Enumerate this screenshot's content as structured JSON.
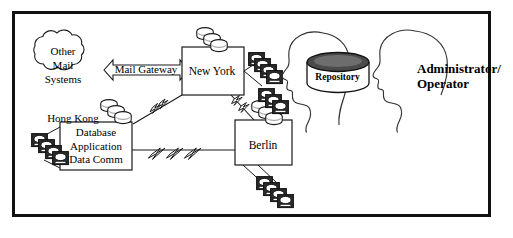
{
  "diagram": {
    "frame": {
      "border_color": "#111111"
    },
    "cloud": {
      "name": "other-mail-systems",
      "line1": "Other",
      "line2": "Mail",
      "line3": "Systems"
    },
    "gateway": {
      "name": "mail-gateway",
      "label": "Mail Gateway",
      "arrow": "double-headed"
    },
    "sites": {
      "new_york": {
        "label": "New York"
      },
      "berlin": {
        "label": "Berlin"
      },
      "hong_kong": {
        "site_label": "Hong Kong",
        "services": "Database\nApplication\nData Comm",
        "service_1": "Database",
        "service_2": "Application",
        "service_3": "Data Comm"
      }
    },
    "repository": {
      "name": "repository-cylinder",
      "label": "Repository",
      "top_fill": "#4a4a4a"
    },
    "people": {
      "name": "administrator-operator",
      "label_line1": "Administrator/",
      "label_line2": "Operator",
      "head_count": 2
    },
    "icons": {
      "disk_stack": "disk-stack-icon",
      "terminal_stack": "terminal-stack-icon",
      "lightning_link": "lightning-link-icon"
    },
    "colors": {
      "ink": "#000000",
      "line": "#222222",
      "terminal_dark": "#2b2b2b",
      "disk_shade": "#9a9a9a",
      "paper": "#ffffff"
    },
    "element_counts": {
      "disk_stacks": 3,
      "terminal_stacks": 3,
      "lightning_links": 3,
      "site_boxes": 3
    }
  }
}
